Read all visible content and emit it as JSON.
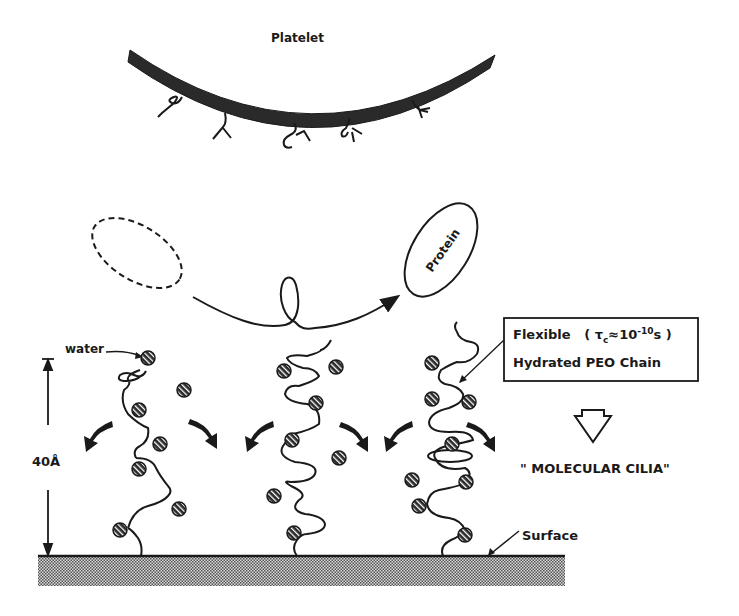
{
  "diagram": {
    "platelet_label": "Platelet",
    "protein_label": "Protein",
    "water_label": "water",
    "height_label": "40Å",
    "info_box": {
      "line1_prefix": "Flexible",
      "line1_tau": "τ",
      "line1_tau_sub": "c",
      "line1_eq": "≈10",
      "line1_exp": "-10",
      "line1_unit": "s",
      "line2": "Hydrated PEO Chain"
    },
    "result_label": "\" MOLECULAR   CILIA\"",
    "surface_label": "Surface",
    "colors": {
      "ink": "#1a1a1a",
      "platelet_fill": "#2a2a2a",
      "surface_fill": "#8a8a8a",
      "background": "#ffffff"
    },
    "chains": [
      {
        "name": "peo-chain-left",
        "water_beads": 8
      },
      {
        "name": "peo-chain-middle",
        "water_beads": 8
      },
      {
        "name": "peo-chain-right",
        "water_beads": 9
      }
    ]
  }
}
